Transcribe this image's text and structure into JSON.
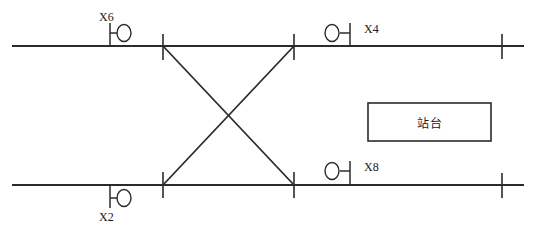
{
  "diagram": {
    "type": "railway-track-schematic",
    "title": "",
    "canvas": {
      "width": 537,
      "height": 240
    },
    "colors": {
      "line": "#2b2b2b",
      "text": "#1a1a1a",
      "background": "#ffffff"
    },
    "tracks": [
      {
        "name": "upper-track",
        "y": 46,
        "x_start": 12,
        "x_end": 524
      },
      {
        "name": "lower-track",
        "y": 185,
        "x_start": 12,
        "x_end": 524
      }
    ],
    "boundary_marks": [
      {
        "name": "switch-mark-upper-left",
        "x": 163,
        "y": 46
      },
      {
        "name": "switch-mark-upper-right",
        "x": 294,
        "y": 46
      },
      {
        "name": "switch-mark-lower-left",
        "x": 163,
        "y": 185
      },
      {
        "name": "switch-mark-lower-right",
        "x": 294,
        "y": 185
      },
      {
        "name": "limit-mark-upper-right",
        "x": 502,
        "y": 46
      },
      {
        "name": "limit-mark-lower-right",
        "x": 502,
        "y": 185
      }
    ],
    "crossover": {
      "name": "scissors-crossover",
      "legs": [
        {
          "name": "leg-upper-left-to-lower-right",
          "x1": 163,
          "y1": 46,
          "x2": 294,
          "y2": 185
        },
        {
          "name": "leg-lower-left-to-upper-right",
          "x1": 163,
          "y1": 185,
          "x2": 294,
          "y2": 46
        }
      ]
    },
    "signals": [
      {
        "id": "X6",
        "label": "X6",
        "name": "signal-x6",
        "track": "upper-track",
        "side": "above",
        "orientation": "circle-right",
        "mast_x": 110,
        "circle_cx": 124,
        "circle_cy": 33,
        "label_x": 99,
        "label_y": 10
      },
      {
        "id": "X4",
        "label": "X4",
        "name": "signal-x4",
        "track": "upper-track",
        "side": "above",
        "orientation": "circle-left",
        "mast_x": 350,
        "circle_cx": 332,
        "circle_cy": 33,
        "label_x": 364,
        "label_y": 22
      },
      {
        "id": "X8",
        "label": "X8",
        "name": "signal-x8",
        "track": "lower-track",
        "side": "above",
        "orientation": "circle-left",
        "mast_x": 350,
        "circle_cx": 332,
        "circle_cy": 171,
        "label_x": 364,
        "label_y": 160
      },
      {
        "id": "X2",
        "label": "X2",
        "name": "signal-x2",
        "track": "lower-track",
        "side": "below",
        "orientation": "circle-right",
        "mast_x": 110,
        "circle_cx": 124,
        "circle_cy": 198,
        "label_x": 99,
        "label_y": 210
      }
    ],
    "platform": {
      "name": "platform-box",
      "label": "站台",
      "x": 368,
      "y": 103,
      "width": 123,
      "height": 38
    }
  }
}
